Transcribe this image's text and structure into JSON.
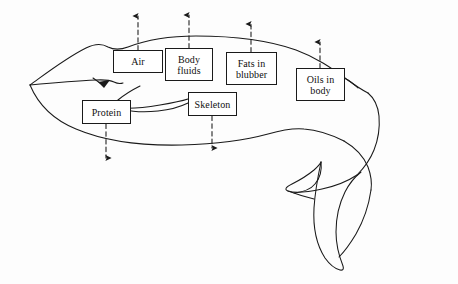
{
  "figure": {
    "background_color": "#fdfdfd",
    "line_color": "#1a1a1a"
  },
  "labels": [
    {
      "id": "air",
      "text": "Air",
      "x": 113,
      "y": 50,
      "w": 50,
      "h": 23
    },
    {
      "id": "body-fluids",
      "text": "Body\nfluids",
      "x": 165,
      "y": 48,
      "w": 48,
      "h": 33
    },
    {
      "id": "fats-in-blubber",
      "text": "Fats in\nblubber",
      "x": 226,
      "y": 52,
      "w": 51,
      "h": 33
    },
    {
      "id": "oils-in-body",
      "text": "Oils in\nbody",
      "x": 296,
      "y": 68,
      "w": 49,
      "h": 33
    },
    {
      "id": "protein",
      "text": "Protein",
      "x": 82,
      "y": 100,
      "w": 49,
      "h": 24
    },
    {
      "id": "skeleton",
      "text": "Skeleton",
      "x": 188,
      "y": 92,
      "w": 49,
      "h": 24
    }
  ],
  "arrows": [
    {
      "id": "air-arrow",
      "direction": "up",
      "x": 138,
      "from_y": 50,
      "to_y": 14
    },
    {
      "id": "body-fluids-arrow",
      "direction": "up",
      "x": 189,
      "from_y": 48,
      "to_y": 13
    },
    {
      "id": "fats-in-blubber-arrow",
      "direction": "up",
      "x": 251,
      "from_y": 52,
      "to_y": 22
    },
    {
      "id": "oils-in-body-arrow",
      "direction": "up",
      "x": 320,
      "from_y": 68,
      "to_y": 40
    },
    {
      "id": "protein-arrow",
      "direction": "down",
      "x": 106,
      "from_y": 124,
      "to_y": 160
    },
    {
      "id": "skeleton-arrow",
      "direction": "down",
      "x": 212,
      "from_y": 116,
      "to_y": 150
    }
  ]
}
